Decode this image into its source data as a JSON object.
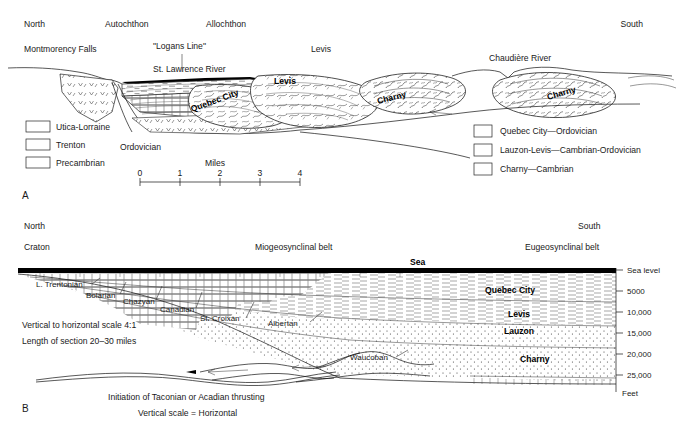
{
  "figure": {
    "panel_a_id": "A",
    "panel_b_id": "B"
  },
  "panel_a": {
    "direction_left": "North",
    "direction_right": "South",
    "tectonic_left": "Autochthon",
    "tectonic_right": "Allochthon",
    "places": {
      "montmorency": "Montmorency Falls",
      "logans_line": "\"Logans Line\"",
      "levis_top": "Levis",
      "chaudiere": "Chaudière River",
      "st_lawrence": "St. Lawrence River"
    },
    "section_labels": {
      "quebec_city": "Quebec City",
      "levis": "Levis",
      "charny_mid": "Charny",
      "charny_right": "Charny"
    },
    "system_label": "Ordovician",
    "legend_left": [
      {
        "id": "utica-lorraine",
        "label": "Utica-Lorraine",
        "pattern": "shale-dash"
      },
      {
        "id": "trenton",
        "label": "Trenton",
        "pattern": "limestone-brick"
      },
      {
        "id": "precambrian",
        "label": "Precambrian",
        "pattern": "crystalline-v"
      }
    ],
    "legend_right": [
      {
        "id": "quebec-city",
        "label": "Quebec City—Ordovician",
        "pattern": "nappe-a"
      },
      {
        "id": "lauzon-levis",
        "label": "Lauzon-Levis—Cambrian-Ordovician",
        "pattern": "nappe-b"
      },
      {
        "id": "charny",
        "label": "Charny—Cambrian",
        "pattern": "nappe-c"
      }
    ],
    "scale": {
      "title": "Miles",
      "ticks": [
        "0",
        "1",
        "2",
        "3",
        "4"
      ]
    }
  },
  "panel_b": {
    "direction_left": "North",
    "direction_right": "South",
    "belt_left": "Craton",
    "belt_mid": "Miogeosynclinal belt",
    "belt_right": "Eugeosynclinal belt",
    "sea_label": "Sea",
    "stage_labels": [
      "L. Trentonian",
      "Bolarian",
      "Chazyan",
      "Canadian",
      "St. Croixan",
      "Albertan",
      "Waucoban"
    ],
    "unit_labels": [
      "Quebec City",
      "Levis",
      "Lauzon",
      "Charny"
    ],
    "depth_axis": {
      "ticks": [
        "Sea level",
        "5000",
        "10,000",
        "15,000",
        "20,000",
        "25,000"
      ],
      "unit": "Feet"
    },
    "notes": {
      "vertical_scale": "Vertical to horizontal scale   4:1",
      "section_length": "Length of section   20–30 miles",
      "inset_caption": "Initiation of Taconian or Acadian thrusting",
      "inset_scale": "Vertical scale = Horizontal"
    }
  },
  "colors": {
    "ink": "#111111",
    "paper": "#ffffff",
    "sea": "#000000"
  }
}
